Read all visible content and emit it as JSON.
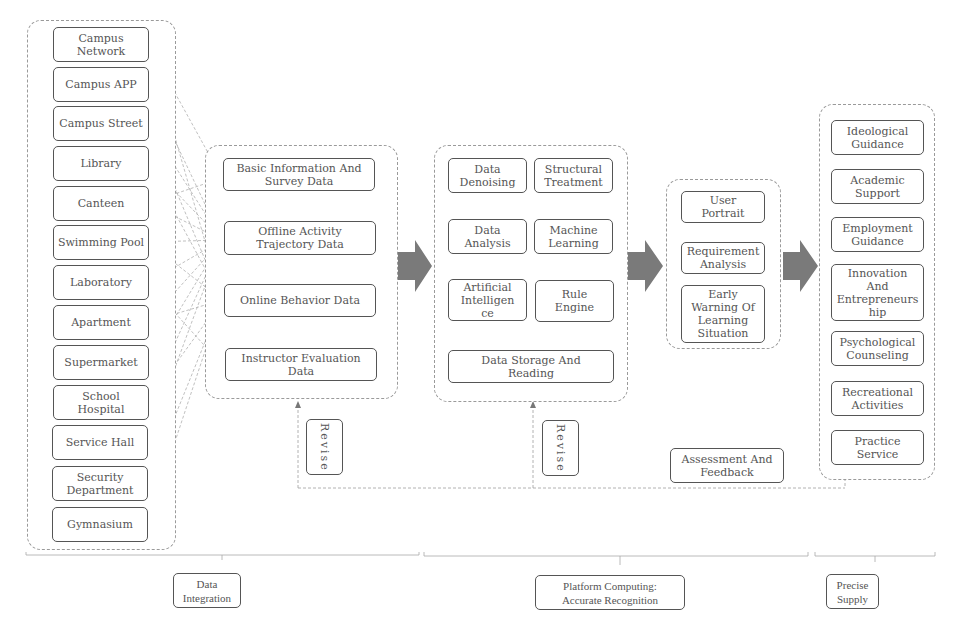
{
  "sources": [
    "Campus\nNetwork",
    "Campus APP",
    "Campus Street",
    "Library",
    "Canteen",
    "Swimming Pool",
    "Laboratory",
    "Apartment",
    "Supermarket",
    "School\nHospital",
    "Service Hall",
    "Security\nDepartment",
    "Gymnasium"
  ],
  "data_types": [
    "Basic Information And\nSurvey Data",
    "Offline Activity\nTrajectory Data",
    "Online Behavior Data",
    "Instructor Evaluation\nData"
  ],
  "processing": {
    "grid": [
      "Data\nDenoising",
      "Structural\nTreatment",
      "Data\nAnalysis",
      "Machine\nLearning",
      "Artificial\nIntelligen\nce",
      "Rule\nEngine"
    ],
    "storage": "Data Storage And\nReading"
  },
  "recognition": [
    "User\nPortrait",
    "Requirement\nAnalysis",
    "Early\nWarning Of\nLearning\nSituation"
  ],
  "services": [
    "Ideological\nGuidance",
    "Academic\nSupport",
    "Employment\nGuidance",
    "Innovation\nAnd\nEntrepreneurs\nhip",
    "Psychological\nCounseling",
    "Recreational\nActivities",
    "Practice\nService"
  ],
  "feedback": {
    "revise_1": "Revise",
    "revise_2": "Revise",
    "assessment": "Assessment And\nFeedback"
  },
  "stages": {
    "integration": "Data\nIntegration",
    "platform": "Platform Computing:\nAccurate Recognition",
    "supply": "Precise\nSupply"
  },
  "colors": {
    "box_border": "#555555",
    "arrow_fill": "#7a7a7a",
    "dashed_line": "#9a9a9a"
  }
}
